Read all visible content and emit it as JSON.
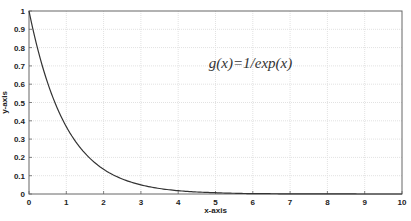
{
  "chart_data": {
    "type": "line",
    "title": "",
    "xlabel": "x-axis",
    "ylabel": "y-axis",
    "xlim": [
      0,
      10
    ],
    "ylim": [
      0,
      1
    ],
    "grid": true,
    "legend": null,
    "x_ticks": [
      "0",
      "1",
      "2",
      "3",
      "4",
      "5",
      "6",
      "7",
      "8",
      "9",
      "10"
    ],
    "y_ticks": [
      "0",
      "0.1",
      "0.2",
      "0.3",
      "0.4",
      "0.5",
      "0.6",
      "0.7",
      "0.8",
      "0.9",
      "1"
    ],
    "annotation": {
      "text": "g(x)=1/exp(x)",
      "x": 6.0,
      "y": 0.69
    },
    "series": [
      {
        "name": "g(x)=1/exp(x)",
        "color": "#333333",
        "x": [
          0,
          0.5,
          1,
          1.5,
          2,
          2.5,
          3,
          3.5,
          4,
          4.5,
          5,
          5.5,
          6,
          6.5,
          7,
          7.5,
          8,
          8.5,
          9,
          9.5,
          10
        ],
        "values": [
          1.0,
          0.607,
          0.368,
          0.223,
          0.135,
          0.082,
          0.05,
          0.03,
          0.018,
          0.011,
          0.007,
          0.004,
          0.002,
          0.0015,
          0.0009,
          0.0006,
          0.0003,
          0.0002,
          0.0001,
          0.0001,
          0.0
        ]
      }
    ]
  },
  "plot_area": {
    "left": 29,
    "right": 402,
    "top": 11,
    "bottom": 194
  },
  "colors": {
    "axis": "#666666",
    "grid": "#e2e2e2",
    "line": "#333333",
    "text": "#222222"
  }
}
